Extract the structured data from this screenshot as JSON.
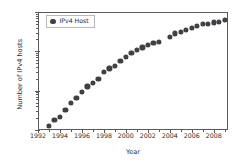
{
  "chart_data": {
    "type": "scatter",
    "title": "",
    "xlabel": "Year",
    "ylabel": "Number of IPv4 hosts",
    "xlim": [
      1992,
      2009.3
    ],
    "ylim": [
      1000000,
      1000000000
    ],
    "yscale": "log",
    "xscale": "linear",
    "grid": false,
    "legend_position": "upper left",
    "marker_color": "#3f3f44",
    "marker_shape": "circle",
    "spine_color": "#5b5b5f",
    "background_color": "#ffffff",
    "xticks": [
      1992,
      1994,
      1996,
      1998,
      2000,
      2002,
      2004,
      2006,
      2008
    ],
    "xticklabels": [
      "1992",
      "1994",
      "1996",
      "1998",
      "2000",
      "2002",
      "2004",
      "2006",
      "2008"
    ],
    "yticks": [
      1000000,
      10000000,
      100000000,
      1000000000
    ],
    "yticklabels": [
      "10",
      "10",
      "10",
      "10"
    ],
    "ytickexponents": [
      "6",
      "7",
      "8",
      "9"
    ],
    "series": [
      {
        "name": "IPv4 Host",
        "x": [
          1993.0,
          1993.5,
          1994.0,
          1994.5,
          1995.0,
          1995.5,
          1996.0,
          1996.5,
          1997.0,
          1997.5,
          1998.0,
          1998.5,
          1999.0,
          1999.5,
          2000.0,
          2000.5,
          2001.0,
          2001.5,
          2002.0,
          2002.5,
          2003.0,
          2004.0,
          2004.5,
          2005.0,
          2005.5,
          2006.0,
          2006.5,
          2007.0,
          2007.5,
          2008.0,
          2008.5,
          2009.0
        ],
        "y": [
          1300000,
          1800000,
          2200000,
          3200000,
          4900000,
          6600000,
          9500000,
          12900000,
          16100000,
          19500000,
          29700000,
          36700000,
          43200000,
          56200000,
          72400000,
          93000000,
          109600000,
          125800000,
          147300000,
          162100000,
          171600000,
          233000000,
          285100000,
          317600000,
          353300000,
          394900000,
          433200000,
          489000000,
          510000000,
          541700000,
          570900000,
          625200000
        ]
      }
    ]
  },
  "legend": {
    "entries": [
      {
        "label": "IPv4 Host",
        "marker": "circle-marker-icon",
        "color": "#3f3f44"
      }
    ]
  },
  "axes": {
    "xaxis_title": "Year",
    "yaxis_title": "Number of IPv4 hosts"
  }
}
